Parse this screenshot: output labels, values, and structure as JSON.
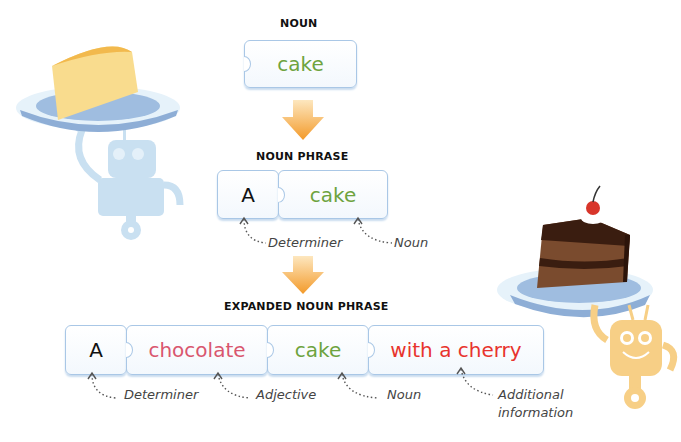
{
  "colors": {
    "noun": "#6ea33e",
    "adjective": "#d9566e",
    "additional": "#e8332d",
    "determiner": "#111111",
    "arrow": "#f5a33a",
    "piece_border": "#a9c7e6"
  },
  "sections": {
    "noun": {
      "heading": "NOUN",
      "pieces": [
        {
          "text": "cake",
          "role": "noun"
        }
      ]
    },
    "noun_phrase": {
      "heading": "NOUN PHRASE",
      "pieces": [
        {
          "text": "A",
          "role": "determiner"
        },
        {
          "text": "cake",
          "role": "noun"
        }
      ],
      "labels": [
        "Determiner",
        "Noun"
      ]
    },
    "expanded_noun_phrase": {
      "heading": "EXPANDED NOUN PHRASE",
      "pieces": [
        {
          "text": "A",
          "role": "determiner"
        },
        {
          "text": "chocolate",
          "role": "adjective"
        },
        {
          "text": "cake",
          "role": "noun"
        },
        {
          "text": "with a cherry",
          "role": "additional"
        }
      ],
      "labels": [
        "Determiner",
        "Adjective",
        "Noun",
        "Additional",
        "information"
      ]
    }
  },
  "illustrations": [
    "robot-holding-sponge-cake",
    "robot-holding-chocolate-cake"
  ]
}
